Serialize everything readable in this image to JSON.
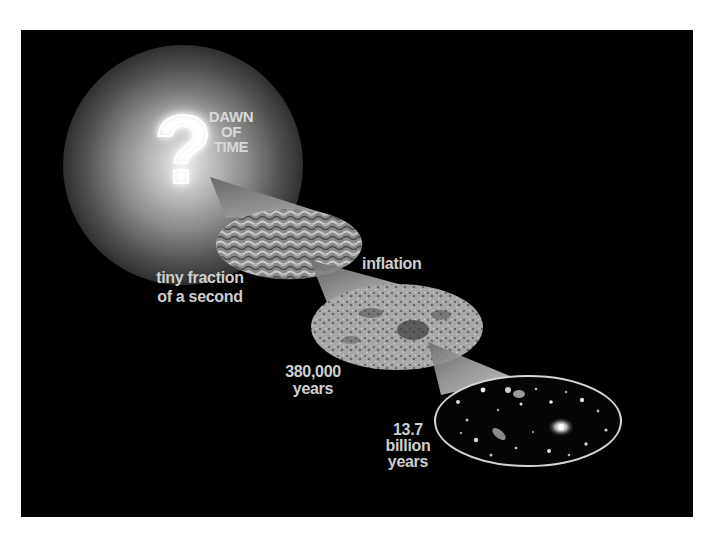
{
  "diagram": {
    "title_label": "DAWN\nOF\nTIME",
    "question_mark": "?",
    "stages": [
      {
        "id": "dawn",
        "label": "DAWN OF TIME",
        "icon": "question-mark-icon"
      },
      {
        "id": "inflation_era",
        "label": "tiny fraction\nof a second",
        "image": "quantum-fluctuations-texture"
      },
      {
        "id": "cmb",
        "label": "380,000\nyears",
        "image": "cosmic-microwave-background-map"
      },
      {
        "id": "today",
        "label": "13.7\nbillion\nyears",
        "image": "deep-field-galaxies"
      }
    ],
    "transition_labels": [
      "inflation"
    ],
    "colors": {
      "background": "#000000",
      "page": "#ffffff",
      "text": "#cfcfcf",
      "cone": "#bdbdbd",
      "glow": "#e8e8e8"
    }
  }
}
